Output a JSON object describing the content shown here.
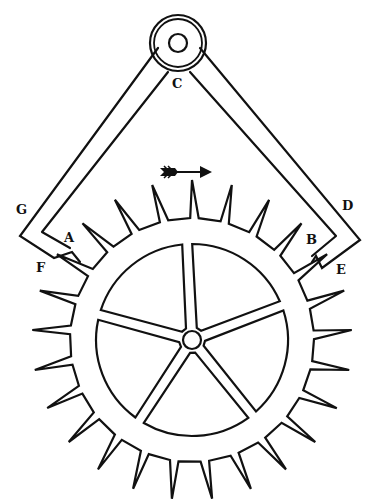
{
  "figure": {
    "ink_color": "#111111",
    "background": "#ffffff"
  },
  "labels": {
    "pivot": "C",
    "left_arm_top": "G",
    "left_pallet": "A",
    "left_pallet_tip": "F",
    "right_arm_top": "D",
    "right_pallet": "B",
    "right_pallet_tip": "E"
  },
  "wheel": {
    "tooth_count": 25,
    "spoke_count": 5
  },
  "arrow": {
    "direction": "right",
    "meaning": "direction of wheel rotation"
  }
}
